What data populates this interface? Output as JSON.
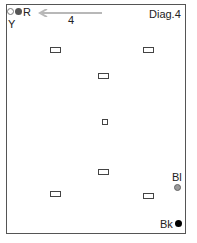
{
  "diagram": {
    "title": "Diag.4",
    "number_label": "4",
    "corner_labels": {
      "top_left_r": "R",
      "top_left_y": "Y",
      "bottom_right_bl": "Bl",
      "bottom_right_bk": "Bk"
    },
    "colors": {
      "gray_dot": "#9a9a9a",
      "dark_dot": "#555555",
      "black_dot": "#000000",
      "arrow": "#b8b8b8"
    },
    "markers": [
      {
        "type": "rect",
        "x": 54,
        "y": 49
      },
      {
        "type": "rect",
        "x": 147,
        "y": 49
      },
      {
        "type": "rect",
        "x": 102,
        "y": 75
      },
      {
        "type": "square",
        "x": 104,
        "y": 121
      },
      {
        "type": "rect",
        "x": 102,
        "y": 171
      },
      {
        "type": "rect",
        "x": 54,
        "y": 193
      },
      {
        "type": "rect",
        "x": 147,
        "y": 195
      }
    ]
  }
}
